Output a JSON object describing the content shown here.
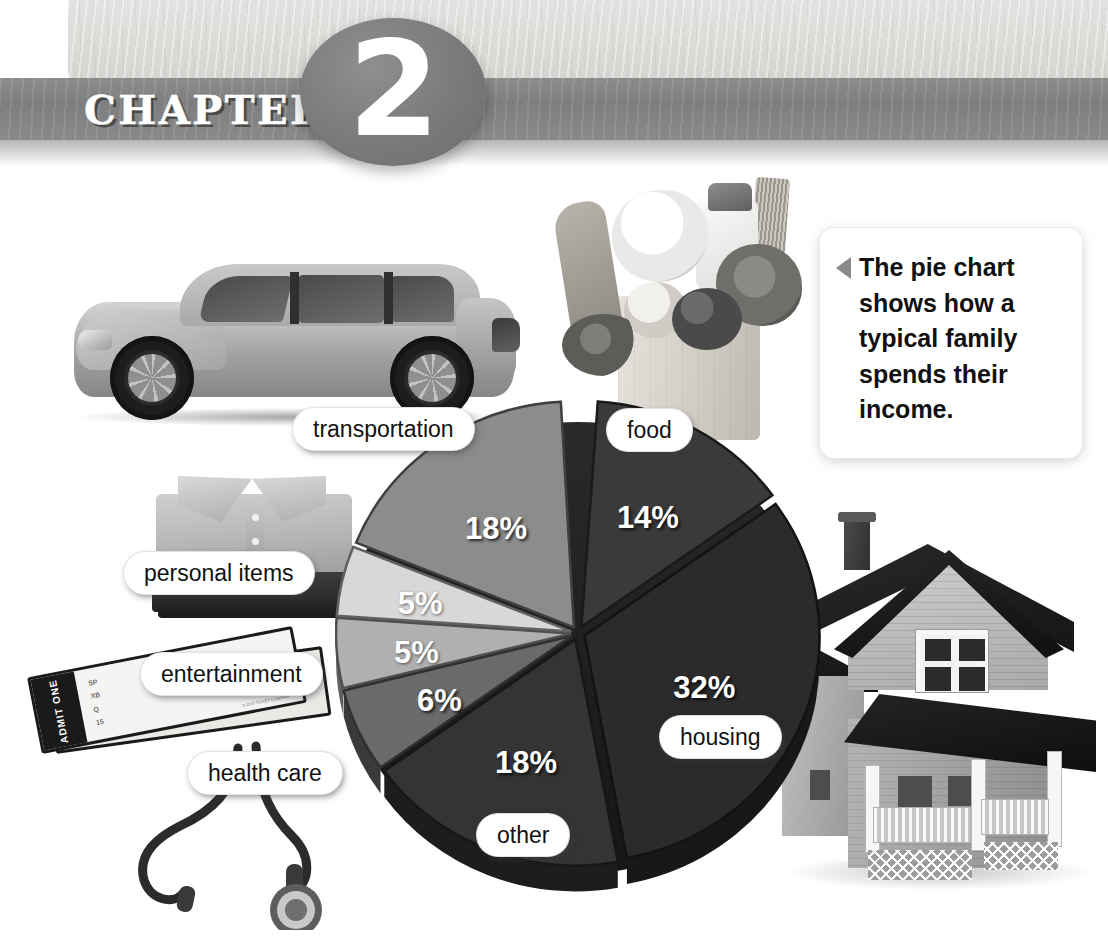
{
  "header": {
    "chapter_word": "CHAPTER",
    "chapter_number": "2"
  },
  "callout": {
    "text": "The pie chart shows how a typical family spends their income.",
    "arrow_icon": "triangle-left-icon"
  },
  "photos": {
    "ticket_stub_text": "ADMIT ONE",
    "ticket_fields": "SP\nADMIT ONE\nXB\nSECTION\nQ\nROW / BOX\n15\nSEAT",
    "ticket_price": "$0.00",
    "ticket_fine_print": "© 2010 TICKET COMPANY"
  },
  "chart_data": {
    "type": "pie",
    "title": "How a typical family spends their income",
    "labels": [
      "food",
      "housing",
      "other",
      "health care",
      "entertainment",
      "personal items",
      "transportation"
    ],
    "values": [
      14,
      32,
      18,
      6,
      5,
      5,
      18
    ],
    "value_labels": [
      "14%",
      "32%",
      "18%",
      "6%",
      "5%",
      "5%",
      "18%"
    ],
    "units": "percent",
    "total": 98,
    "legend": "in-place callout pills",
    "grid": false,
    "slice_colors": [
      "#3a3a3a",
      "#2b2b2b",
      "#343434",
      "#6a6a6a",
      "#b0b0b0",
      "#d8d8d8",
      "#8c8c8c"
    ]
  },
  "pie_labels": {
    "food": "food",
    "housing": "housing",
    "other": "other",
    "health_care": "health care",
    "entertainment": "entertainment",
    "personal_items": "personal items",
    "transportation": "transportation"
  },
  "pie_percents": {
    "food": "14%",
    "housing": "32%",
    "other": "18%",
    "health_care": "6%",
    "entertainment": "5%",
    "personal_items": "5%",
    "transportation": "18%"
  }
}
